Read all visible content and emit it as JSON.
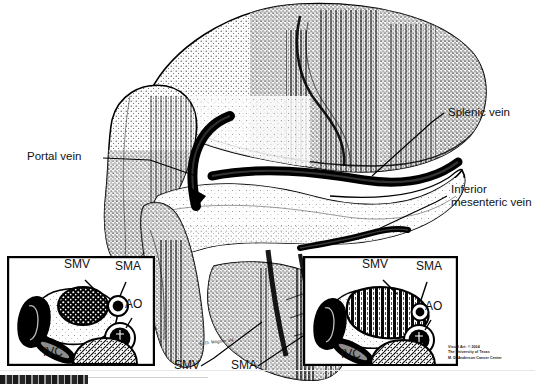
{
  "figure": {
    "domain": "medical-anatomical-illustration",
    "background_color": "#ffffff",
    "ink_color": "#000000",
    "style": "stippled halftone line drawing, scanned"
  },
  "labels": {
    "portal_vein": "Portal vein",
    "splenic_vein": "Splenic vein",
    "inferior_mesenteric_vein_line1": "Inferior",
    "inferior_mesenteric_vein_line2": "mesenteric vein",
    "smv_main": "SMV",
    "sma_main": "SMA"
  },
  "inset_left": {
    "name": "cross-section-normal",
    "smv": "SMV",
    "sma": "SMA",
    "ao": "AO",
    "ivc": "IVC"
  },
  "inset_right": {
    "name": "cross-section-tumor-encasement",
    "smv": "SMV",
    "sma": "SMA",
    "ao": "AO",
    "ivc": "IVC"
  },
  "credit": {
    "line1": "Visual Art: © 2004",
    "line2": "The University of Texas",
    "line3": "M. D. Anderson Cancer Center"
  },
  "signature": {
    "text": "K. D. Wagner '04"
  }
}
